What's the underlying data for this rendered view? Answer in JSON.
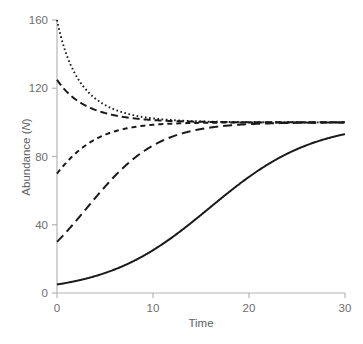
{
  "chart_data": {
    "type": "line",
    "title": "",
    "xlabel": "Time",
    "ylabel": "Abundance (N)",
    "ylabel_plain": "Abundance (",
    "ylabel_italic": "N",
    "ylabel_close": ")",
    "xlim": [
      0,
      30
    ],
    "ylim": [
      0,
      160
    ],
    "xticks": [
      0,
      10,
      20,
      30
    ],
    "yticks": [
      0,
      40,
      80,
      120,
      160
    ],
    "xtick_labels": [
      "0",
      "10",
      "20",
      "30"
    ],
    "ytick_labels": [
      "0",
      "40",
      "80",
      "120",
      "160"
    ],
    "grid": false,
    "legend": "none",
    "carrying_capacity": 100,
    "annotation": "Logistic growth curves converging to carrying capacity K = 100 from five different initial abundances",
    "series": [
      {
        "name": "N0 = 160 (dotted)",
        "linestyle": "dotted",
        "initial_value": 160,
        "final_value": 100,
        "color": "#1a1a1a",
        "x": [
          0,
          1,
          2,
          3,
          4,
          5,
          6,
          7,
          8,
          9,
          10,
          12,
          14,
          16,
          18,
          20,
          22,
          24,
          26,
          28,
          30
        ],
        "values": [
          160,
          141.5,
          128.6,
          119.7,
          113.6,
          109.4,
          106.5,
          104.5,
          103.1,
          102.1,
          101.5,
          100.7,
          100.3,
          100.15,
          100.07,
          100.03,
          100.02,
          100.01,
          100,
          100,
          100
        ]
      },
      {
        "name": "N0 = 125 (long dash)",
        "linestyle": "long-dash",
        "initial_value": 125,
        "final_value": 100,
        "color": "#1a1a1a",
        "x": [
          0,
          1,
          2,
          3,
          4,
          5,
          6,
          7,
          8,
          9,
          10,
          12,
          14,
          16,
          18,
          20,
          22,
          24,
          26,
          28,
          30
        ],
        "values": [
          125,
          118.4,
          113.5,
          109.9,
          107.3,
          105.4,
          103.9,
          102.9,
          102.1,
          101.5,
          101.1,
          100.6,
          100.3,
          100.15,
          100.08,
          100.04,
          100.02,
          100.01,
          100,
          100,
          100
        ]
      },
      {
        "name": "N0 = 70 (short dash)",
        "linestyle": "short-dash",
        "initial_value": 70,
        "final_value": 100,
        "color": "#1a1a1a",
        "x": [
          0,
          1,
          2,
          3,
          4,
          5,
          6,
          7,
          8,
          9,
          10,
          12,
          14,
          16,
          18,
          20,
          22,
          24,
          26,
          28,
          30
        ],
        "values": [
          70,
          76.8,
          82.4,
          86.8,
          90.2,
          92.7,
          94.6,
          96.0,
          97.0,
          97.8,
          98.3,
          99.1,
          99.5,
          99.7,
          99.85,
          99.92,
          99.96,
          99.98,
          99.99,
          100,
          100
        ]
      },
      {
        "name": "N0 = 30 (medium dash)",
        "linestyle": "medium-dash",
        "initial_value": 30,
        "final_value": 100,
        "color": "#1a1a1a",
        "x": [
          0,
          1,
          2,
          3,
          4,
          5,
          6,
          7,
          8,
          9,
          10,
          12,
          14,
          16,
          18,
          20,
          22,
          24,
          26,
          28,
          30
        ],
        "values": [
          30,
          35.8,
          42.2,
          48.9,
          55.7,
          62.3,
          68.4,
          73.9,
          78.7,
          82.7,
          86.1,
          91.0,
          94.2,
          96.3,
          97.7,
          98.5,
          99.1,
          99.4,
          99.6,
          99.8,
          99.9
        ]
      },
      {
        "name": "N0 = 5 (solid)",
        "linestyle": "solid",
        "initial_value": 5,
        "final_value": 96,
        "color": "#1a1a1a",
        "x": [
          0,
          1,
          2,
          3,
          4,
          5,
          6,
          7,
          8,
          9,
          10,
          12,
          14,
          16,
          18,
          20,
          22,
          24,
          26,
          28,
          30
        ],
        "values": [
          5,
          5.8,
          6.8,
          8.0,
          9.4,
          11.0,
          12.9,
          15.1,
          17.6,
          20.5,
          23.8,
          31.6,
          40.7,
          50.6,
          60.5,
          69.6,
          77.4,
          83.5,
          88.1,
          91.4,
          93.8
        ]
      }
    ]
  },
  "axes": {
    "x_axis_name": "time-axis",
    "y_axis_name": "abundance-axis"
  }
}
